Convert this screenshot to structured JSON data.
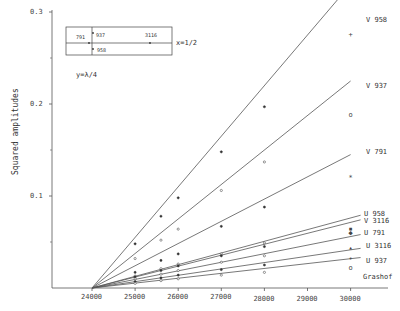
{
  "chart_data": {
    "type": "line",
    "title": "",
    "xlabel": "",
    "ylabel": "Squared amplitudes",
    "xlim": [
      23200,
      30600
    ],
    "ylim": [
      0,
      0.31
    ],
    "x_ticks": [
      "24000",
      "25000",
      "26000",
      "27000",
      "28000",
      "29000",
      "30000"
    ],
    "y_ticks": [
      "0.1",
      "0.2",
      "0.3"
    ],
    "grid": false,
    "annotation_vertical": "Grashof",
    "inset": {
      "labels": [
        "791",
        "937",
        "3116",
        "958"
      ],
      "x_label": "x=1/2",
      "y_label": "y=λ/4"
    },
    "series": [
      {
        "name": "V 958",
        "line": [
          [
            24000,
            0
          ],
          [
            30000,
            0.33
          ]
        ],
        "x": [
          25000,
          25600,
          26000,
          27000,
          28000,
          30000
        ],
        "values": [
          0.048,
          0.078,
          0.098,
          0.148,
          0.197,
          0.275
        ]
      },
      {
        "name": "V 937",
        "line": [
          [
            24000,
            0
          ],
          [
            30000,
            0.225
          ]
        ],
        "x": [
          25000,
          25600,
          26000,
          27000,
          28000,
          30000
        ],
        "values": [
          0.032,
          0.052,
          0.064,
          0.106,
          0.137,
          0.188
        ]
      },
      {
        "name": "V 791",
        "line": [
          [
            24000,
            0
          ],
          [
            30000,
            0.145
          ]
        ],
        "x": [
          25000,
          25600,
          26000,
          27000,
          28000,
          30000
        ],
        "values": [
          0.017,
          0.03,
          0.037,
          0.067,
          0.088,
          0.12
        ]
      },
      {
        "name": "U 958",
        "line": [
          [
            24000,
            0
          ],
          [
            30000,
            0.078
          ]
        ],
        "x": [
          25000,
          25600,
          26000,
          27000,
          28000,
          30000
        ],
        "values": [
          0.013,
          0.021,
          0.026,
          0.037,
          0.049,
          0.064
        ]
      },
      {
        "name": "V 3116",
        "line": [
          [
            24000,
            0
          ],
          [
            30000,
            0.073
          ]
        ],
        "x": [
          25000,
          25600,
          26000,
          27000,
          28000,
          30000
        ],
        "values": [
          0.012,
          0.019,
          0.024,
          0.035,
          0.045,
          0.06
        ]
      },
      {
        "name": "U 791",
        "line": [
          [
            24000,
            0
          ],
          [
            30000,
            0.057
          ]
        ],
        "x": [
          25000,
          25600,
          26000,
          27000,
          28000,
          30000
        ],
        "values": [
          0.01,
          0.015,
          0.019,
          0.028,
          0.035,
          0.044
        ]
      },
      {
        "name": "U 3116",
        "line": [
          [
            24000,
            0
          ],
          [
            30000,
            0.042
          ]
        ],
        "x": [
          25000,
          25600,
          26000,
          27000,
          28000,
          30000
        ],
        "values": [
          0.007,
          0.011,
          0.014,
          0.02,
          0.025,
          0.032
        ]
      },
      {
        "name": "U 937",
        "line": [
          [
            24000,
            0
          ],
          [
            30000,
            0.032
          ]
        ],
        "x": [
          25000,
          25600,
          26000,
          27000,
          28000,
          30000
        ],
        "values": [
          0.005,
          0.008,
          0.01,
          0.014,
          0.017,
          0.022
        ]
      }
    ]
  }
}
